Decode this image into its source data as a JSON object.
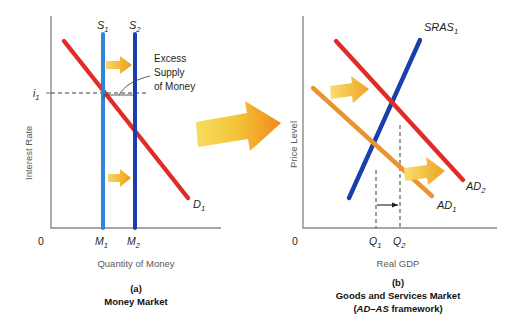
{
  "figure": {
    "type": "economics-diagram"
  },
  "panel_a": {
    "caption_letter": "(a)",
    "caption_title": "Money Market",
    "y_axis_label": "Interest Rate",
    "x_axis_label": "Quantity of Money",
    "origin_label": "0",
    "y_ticks": [
      {
        "label": "i",
        "sub": "1"
      }
    ],
    "x_ticks": [
      {
        "label": "M",
        "sub": "1"
      },
      {
        "label": "M",
        "sub": "2"
      }
    ],
    "curves": [
      {
        "name": "money-supply-1",
        "label": "S",
        "sub": "1",
        "color": "#2f86d8",
        "kind": "vertical"
      },
      {
        "name": "money-supply-2",
        "label": "S",
        "sub": "2",
        "color": "#1b3faa",
        "kind": "vertical"
      },
      {
        "name": "money-demand-1",
        "label": "D",
        "sub": "1",
        "color": "#e02b28",
        "kind": "downward-sloping"
      }
    ],
    "annotation": {
      "line1": "Excess",
      "line2": "Supply",
      "line3": "of Money"
    },
    "shift_arrow": {
      "name": "supply-shift-arrow",
      "color": "#f0ad28",
      "direction": "right"
    }
  },
  "panel_b": {
    "caption_letter": "(b)",
    "caption_title": "Goods and Services Market",
    "caption_subtitle_italic": "AD–AS",
    "caption_subtitle_rest": " framework)",
    "caption_subtitle_open": "(",
    "y_axis_label": "Price Level",
    "x_axis_label": "Real GDP",
    "origin_label": "0",
    "x_ticks": [
      {
        "label": "Q",
        "sub": "1"
      },
      {
        "label": "Q",
        "sub": "2"
      }
    ],
    "curves": [
      {
        "name": "short-run-aggregate-supply",
        "label": "SRAS",
        "sub": "1",
        "color": "#1b3faa",
        "kind": "upward-sloping"
      },
      {
        "name": "aggregate-demand-1",
        "label": "AD",
        "sub": "1",
        "color": "#eb9331",
        "kind": "downward-sloping"
      },
      {
        "name": "aggregate-demand-2",
        "label": "AD",
        "sub": "2",
        "color": "#e02b28",
        "kind": "downward-sloping"
      }
    ],
    "shift_arrows": [
      {
        "name": "ad-shift-arrow-upper",
        "color": "#f0ad28",
        "direction": "right"
      },
      {
        "name": "ad-shift-arrow-lower",
        "color": "#f0ad28",
        "direction": "right"
      }
    ],
    "output_shift_arrow": {
      "name": "output-increase-arrow",
      "direction": "right"
    }
  },
  "linking_arrow": {
    "name": "panel-linking-arrow",
    "direction": "right",
    "color_start": "#f5d14a",
    "color_end": "#f08a1c"
  },
  "colors": {
    "supply_light_blue": "#2f86d8",
    "supply_dark_blue": "#1b3faa",
    "demand_red": "#e02b28",
    "ad_orange": "#eb9331",
    "arrow_yellow": "#f0ad28",
    "axis_gray": "#8a8a8a"
  }
}
